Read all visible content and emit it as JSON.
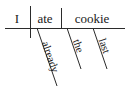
{
  "diagram": {
    "type": "reed-kellogg-sentence-diagram",
    "sentence": "I ate the last cookie already",
    "ink_color": "#2b2b2b",
    "text_color": "#1a1a1a",
    "background_color": "#ffffff",
    "baseline": {
      "label": "baseline",
      "x1": 5,
      "y1": 28,
      "x2": 125,
      "y2": 28
    },
    "dividers": [
      {
        "label": "subject-verb-divider",
        "x": 30,
        "y1": 6,
        "y2": 38
      },
      {
        "label": "verb-object-divider",
        "x": 61,
        "y1": 8,
        "y2": 28
      }
    ],
    "baseline_words": [
      {
        "id": "subject",
        "text": "I",
        "x": 17,
        "y": 23,
        "anchor": "middle"
      },
      {
        "id": "verb",
        "text": "ate",
        "x": 45,
        "y": 23,
        "anchor": "middle"
      },
      {
        "id": "object",
        "text": "cookie",
        "x": 92,
        "y": 23,
        "anchor": "middle"
      }
    ],
    "modifiers": [
      {
        "id": "adverb-already",
        "text": "already",
        "attaches_to": "verb",
        "line": {
          "x1": 37,
          "y1": 28,
          "x2": 57,
          "y2": 86
        },
        "text_x": 47,
        "text_y": 58,
        "rotate": 71
      },
      {
        "id": "article-the",
        "text": "the",
        "attaches_to": "object",
        "line": {
          "x1": 67,
          "y1": 28,
          "x2": 81,
          "y2": 69
        },
        "text_x": 75,
        "text_y": 47,
        "rotate": 71
      },
      {
        "id": "adjective-last",
        "text": "last",
        "attaches_to": "object",
        "line": {
          "x1": 93,
          "y1": 28,
          "x2": 107,
          "y2": 69
        },
        "text_x": 101,
        "text_y": 47,
        "rotate": 71
      }
    ]
  }
}
